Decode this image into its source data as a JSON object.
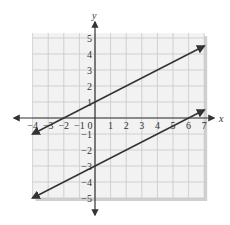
{
  "chart_data": {
    "type": "line",
    "title": "",
    "xlabel": "x",
    "ylabel": "y",
    "xlim": [
      -4,
      7
    ],
    "ylim": [
      -5,
      5
    ],
    "grid": true,
    "x_ticks": [
      "-4",
      "-3",
      "-2",
      "-1",
      "0",
      "1",
      "2",
      "3",
      "4",
      "5",
      "6",
      "7"
    ],
    "y_ticks": [
      "5",
      "4",
      "3",
      "2",
      "1",
      "-1",
      "-2",
      "-3",
      "-4",
      "-5"
    ],
    "series": [
      {
        "name": "line-1",
        "equation": "y = 0.5x + 1",
        "x": [
          -4,
          7
        ],
        "y": [
          -1,
          4.5
        ],
        "arrows": "both"
      },
      {
        "name": "line-2",
        "equation": "y = 0.5x - 3",
        "x": [
          -4,
          7
        ],
        "y": [
          -5,
          0.5
        ],
        "arrows": "both"
      }
    ],
    "colors": {
      "line": "#333333",
      "grid": "#c8c8c8",
      "background": "#f2f2f2",
      "shadow": "#cfcfcf",
      "axis": "#333333"
    }
  }
}
